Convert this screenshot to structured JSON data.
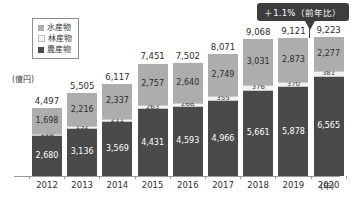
{
  "chart_data": {
    "type": "bar",
    "subtype": "stacked-bar",
    "title": "",
    "xlabel": "年",
    "ylabel": "",
    "unit_label": "(億円)",
    "year_axis_unit": "(年)",
    "categories": [
      "2012",
      "2013",
      "2014",
      "2015",
      "2016",
      "2017",
      "2018",
      "2019",
      "2020"
    ],
    "series": [
      {
        "name": "農産物",
        "key": "agri",
        "color": "#4a4a4a",
        "values": [
          2680,
          3136,
          3569,
          4431,
          4593,
          4966,
          5661,
          5878,
          6565
        ],
        "labels": [
          "2,680",
          "3,136",
          "3,569",
          "4,431",
          "4,593",
          "4,966",
          "5,661",
          "5,878",
          "6,565"
        ]
      },
      {
        "name": "林産物",
        "key": "fore",
        "color": "#f2f2f2",
        "values": [
          118,
          152,
          211,
          263,
          268,
          355,
          376,
          370,
          381
        ],
        "labels": [
          "118",
          "152",
          "211",
          "263",
          "268",
          "355",
          "376",
          "370",
          "381"
        ]
      },
      {
        "name": "水産物",
        "key": "fish",
        "color": "#adadad",
        "values": [
          1698,
          2216,
          2337,
          2757,
          2640,
          2749,
          3031,
          2873,
          2277
        ],
        "labels": [
          "1,698",
          "2,216",
          "2,337",
          "2,757",
          "2,640",
          "2,749",
          "3,031",
          "2,873",
          "2,277"
        ]
      }
    ],
    "totals": [
      4497,
      5505,
      6117,
      7451,
      7502,
      8071,
      9068,
      9121,
      9223
    ],
    "total_labels": [
      "4,497",
      "5,505",
      "6,117",
      "7,451",
      "7,502",
      "8,071",
      "9,068",
      "9,121",
      "9,223"
    ],
    "stack_order": [
      "agri",
      "fore",
      "fish"
    ],
    "ylim": [
      0,
      9800
    ],
    "grid": false,
    "legend_position": "top-left",
    "annotations": [
      {
        "text": "＋1.1%（前年比）",
        "target_category": "2020",
        "style": "dark-callout-with-arrow"
      }
    ]
  },
  "legend": {
    "items": [
      {
        "label": "水産物",
        "color": "#adadad"
      },
      {
        "label": "林産物",
        "color": "#f2f2f2"
      },
      {
        "label": "農産物",
        "color": "#4a4a4a"
      }
    ]
  },
  "callout": {
    "text": "＋1.1%（前年比）",
    "background": "#3d3d3d",
    "text_color": "#ffffff"
  },
  "axis": {
    "unit_label": "(億円)",
    "year_unit": "(年)"
  }
}
